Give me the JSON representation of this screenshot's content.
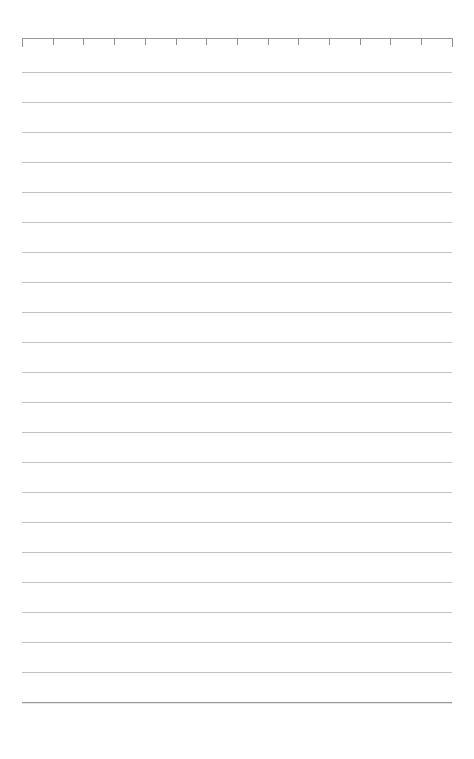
{
  "page": {
    "width": 474,
    "height": 759,
    "background_color": "#ffffff",
    "content_text": ""
  },
  "ruler": {
    "name": "top-measurement-ruler",
    "baseline_y": 38,
    "start_x": 22,
    "end_x": 452,
    "length_px": 430,
    "tick_count": 15,
    "tick_spacing_px": 30.7,
    "tick_height_px": 7,
    "end_tick_height_px": 9,
    "line_color": "#9a9a9a",
    "tick_color": "#8f8f8f",
    "label": ""
  },
  "rules": {
    "name": "ruled-lines",
    "first_line_y": 72,
    "line_spacing_px": 30,
    "line_count": 22,
    "start_x": 22,
    "end_x": 452,
    "line_width_px": 430,
    "line_color": "#c2c2c2",
    "last_line_color": "#989898",
    "last_line_y": 712
  },
  "margins": {
    "left_px": 22,
    "right_px": 22,
    "top_px": 38,
    "bottom_px": 47
  }
}
